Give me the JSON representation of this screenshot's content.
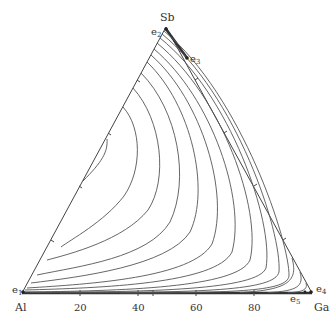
{
  "diagram": {
    "type": "ternary liquidus projection",
    "vertices": {
      "top": "Sb",
      "left": "Al",
      "right": "Ga"
    },
    "bottom_axis_ticks": [
      "20",
      "40",
      "60",
      "80"
    ],
    "eutectic_labels": {
      "e1": {
        "base": "e",
        "sub": "1"
      },
      "e2": {
        "base": "e",
        "sub": "2"
      },
      "e3": {
        "base": "e",
        "sub": "3"
      },
      "e4": {
        "base": "e",
        "sub": "4"
      },
      "e5": {
        "base": "e",
        "sub": "5"
      }
    },
    "isotherm_count": 14,
    "colors": {
      "lines": "#555555",
      "edges": "#444444",
      "text": "#333333"
    }
  }
}
